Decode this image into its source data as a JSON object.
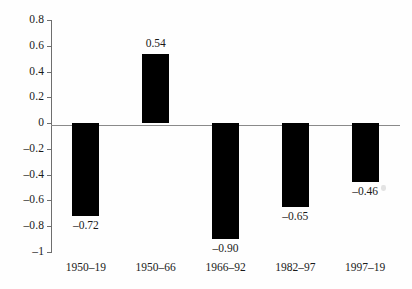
{
  "chart_data": {
    "type": "bar",
    "title": "",
    "subtitle": "",
    "xlabel": "",
    "ylabel": "",
    "categories": [
      "1950–19",
      "1950–66",
      "1966–92",
      "1982–97",
      "1997–19"
    ],
    "values": [
      -0.72,
      0.54,
      -0.9,
      -0.65,
      -0.46
    ],
    "value_labels": [
      "–0.72",
      "0.54",
      "–0.90",
      "–0.65",
      "–0.46"
    ],
    "ylim": [
      -1,
      0.8
    ],
    "ytick_values": [
      0.8,
      0.6,
      0.4,
      0.2,
      0,
      -0.2,
      -0.4,
      -0.6,
      -0.8,
      -1
    ],
    "ytick_labels": [
      "0.8",
      "0.6",
      "0.4",
      "0.2",
      "0",
      "–0.2",
      "–0.4",
      "–0.6",
      "–0.8",
      "–1"
    ],
    "grid": false,
    "legend": false,
    "legend_position": "none",
    "bar_color": "#000000",
    "axis_color": "#6e6e6e",
    "zero_line_color": "#8a8a8a",
    "background_color": "#fefefe"
  }
}
